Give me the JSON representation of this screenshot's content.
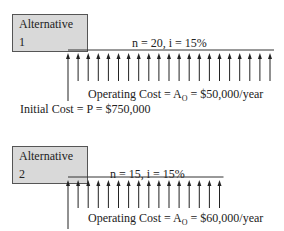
{
  "alt1": {
    "label": "Alternative 1",
    "params": "n = 20, i = 15%",
    "op_prefix": "Operating Cost = A",
    "op_sub": "O",
    "op_suffix": " = $50,000/year",
    "initial": "Initial Cost = P = $750,000",
    "periods": 20
  },
  "alt2": {
    "label": "Alternative 2",
    "params": "n = 15, i = 15%",
    "op_prefix": "Operating Cost = A",
    "op_sub": "O",
    "op_suffix": " = $60,000/year",
    "periods": 15
  }
}
